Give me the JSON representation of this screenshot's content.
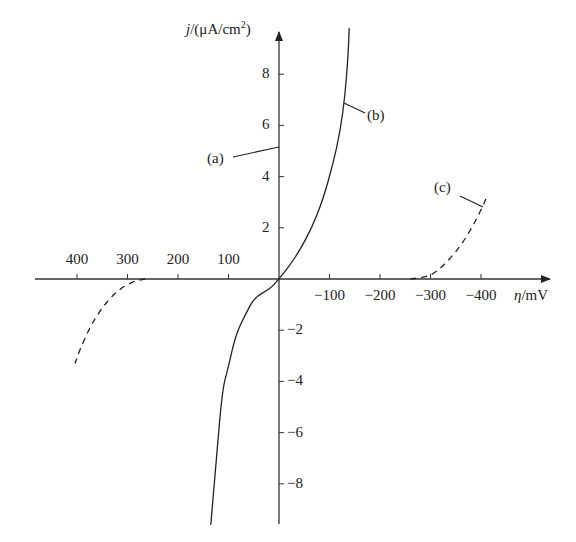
{
  "chart_data": {
    "type": "line",
    "title": "",
    "xlabel": "η/mV",
    "ylabel": "j/(μA/cm²)",
    "xlabel_parts": {
      "symbol": "η",
      "unit": "/mV"
    },
    "ylabel_parts": {
      "symbol": "j",
      "unit": "/(μA/cm",
      "sup": "2",
      "close": ")"
    },
    "x_direction": "positive values to the left, negative to the right",
    "xlim": [
      450,
      -540
    ],
    "ylim": [
      -9.5,
      9.7
    ],
    "grid": false,
    "x_ticks": [
      {
        "value": 400,
        "label": "400"
      },
      {
        "value": 300,
        "label": "300"
      },
      {
        "value": 200,
        "label": "200"
      },
      {
        "value": 100,
        "label": "100"
      },
      {
        "value": -100,
        "label": "−100"
      },
      {
        "value": -200,
        "label": "−200"
      },
      {
        "value": -300,
        "label": "−300"
      },
      {
        "value": -400,
        "label": "−400"
      }
    ],
    "y_ticks": [
      {
        "value": 8,
        "label": "8"
      },
      {
        "value": 6,
        "label": "6"
      },
      {
        "value": 4,
        "label": "4"
      },
      {
        "value": 2,
        "label": "2"
      },
      {
        "value": -2,
        "label": "−2"
      },
      {
        "value": -4,
        "label": "−4"
      },
      {
        "value": -6,
        "label": "−6"
      },
      {
        "value": -8,
        "label": "−8"
      }
    ],
    "series": [
      {
        "name": "(a)",
        "style": "solid",
        "description": "y-axis annotation (a), pointer to j axis near j=5",
        "annotation": {
          "label": "(a)",
          "points_to": {
            "x": 0,
            "y": 5.1
          }
        }
      },
      {
        "name": "(b)",
        "style": "solid",
        "points": [
          {
            "x": 135,
            "y": -9.6
          },
          {
            "x": 124,
            "y": -7.0
          },
          {
            "x": 112,
            "y": -4.3
          },
          {
            "x": 101,
            "y": -3.5
          },
          {
            "x": 86,
            "y": -2.2
          },
          {
            "x": 67,
            "y": -1.4
          },
          {
            "x": 48,
            "y": -0.7
          },
          {
            "x": 18,
            "y": -0.4
          },
          {
            "x": 0,
            "y": 0
          },
          {
            "x": -22,
            "y": 0.55
          },
          {
            "x": -42,
            "y": 1.15
          },
          {
            "x": -65,
            "y": 2.0
          },
          {
            "x": -87,
            "y": 3.1
          },
          {
            "x": -107,
            "y": 4.5
          },
          {
            "x": -121,
            "y": 5.75
          },
          {
            "x": -131,
            "y": 7.2
          },
          {
            "x": -137,
            "y": 8.8
          },
          {
            "x": -139,
            "y": 9.8
          }
        ]
      },
      {
        "name": "(c)",
        "style": "dashed",
        "points_cathodic": [
          {
            "x": -260,
            "y": 0
          },
          {
            "x": -300,
            "y": 0.1
          },
          {
            "x": -330,
            "y": 0.6
          },
          {
            "x": -360,
            "y": 1.3
          },
          {
            "x": -385,
            "y": 2.1
          },
          {
            "x": -405,
            "y": 2.9
          },
          {
            "x": -413,
            "y": 3.3
          }
        ],
        "points_anodic": [
          {
            "x": 265,
            "y": 0
          },
          {
            "x": 290,
            "y": -0.1
          },
          {
            "x": 320,
            "y": -0.45
          },
          {
            "x": 350,
            "y": -1.1
          },
          {
            "x": 375,
            "y": -1.9
          },
          {
            "x": 395,
            "y": -2.8
          },
          {
            "x": 404,
            "y": -3.3
          }
        ]
      }
    ],
    "annotations": [
      {
        "label": "(a)"
      },
      {
        "label": "(b)"
      },
      {
        "label": "(c)"
      }
    ]
  }
}
